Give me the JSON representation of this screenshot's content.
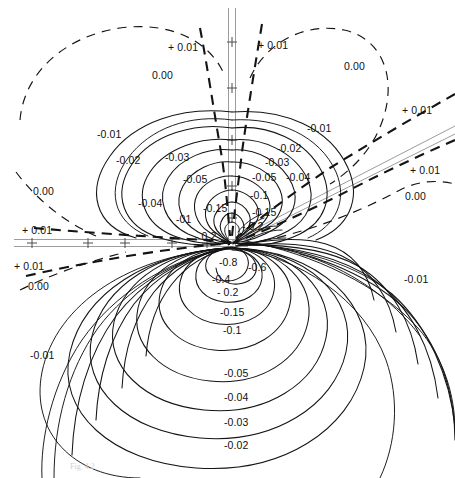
{
  "figure": {
    "title": "",
    "type": "contour-plot",
    "background": "#ffffff",
    "ink_color": "#141414",
    "axis_color": "#9a9a9a",
    "width": 455,
    "height": 478
  },
  "caption": {
    "text": "Fig. 4.2"
  },
  "axes": {
    "vertical": {
      "name": "vertical-axis",
      "x": 232,
      "y_top": 8,
      "y_bottom": 248,
      "ticks": [
        {
          "y": 42
        },
        {
          "y": 88
        },
        {
          "y": 140
        },
        {
          "y": 186
        },
        {
          "y": 218
        },
        {
          "y": 243
        }
      ]
    },
    "horizontal": {
      "name": "horizontal-axis",
      "y": 243,
      "x_left": 14,
      "x_right": 246,
      "ticks": [
        {
          "x": 32
        },
        {
          "x": 88
        },
        {
          "x": 125
        },
        {
          "x": 172
        },
        {
          "x": 207
        }
      ]
    },
    "diagonal": {
      "name": "diagonal-axis",
      "x1": 232,
      "y1": 240,
      "x2": 452,
      "y2": 128
    }
  },
  "chart_data": {
    "type": "contour",
    "title": "",
    "xlabel": "",
    "ylabel": "",
    "grid": false,
    "legend": "none",
    "center": {
      "x": 232,
      "y": 240
    },
    "levels_negative": [
      -0.8,
      -0.6,
      -0.4,
      -0.2,
      -0.15,
      -0.1,
      -0.05,
      -0.04,
      -0.03,
      -0.02,
      -0.01
    ],
    "levels_zero": [
      0.0
    ],
    "levels_positive": [
      0.01
    ],
    "line_styles": {
      "negative": "solid",
      "zero": "dashed",
      "positive": "dashed"
    },
    "contour_labels": [
      {
        "text": "+ 0.01",
        "x": 168,
        "y": 42,
        "value": 0.01
      },
      {
        "text": "+ 0.01",
        "x": 258,
        "y": 40,
        "value": 0.01
      },
      {
        "text": "0.00",
        "x": 152,
        "y": 70,
        "value": 0.0
      },
      {
        "text": "0.00",
        "x": 344,
        "y": 61,
        "value": 0.0
      },
      {
        "text": "+ 0.01",
        "x": 402,
        "y": 105,
        "value": 0.01
      },
      {
        "text": "-0.01",
        "x": 307,
        "y": 123,
        "value": -0.01
      },
      {
        "text": "-0.01",
        "x": 97,
        "y": 129,
        "value": -0.01
      },
      {
        "text": "-0.02",
        "x": 277,
        "y": 143,
        "value": -0.02
      },
      {
        "text": "-0.02",
        "x": 116,
        "y": 155,
        "value": -0.02
      },
      {
        "text": "-0.03",
        "x": 165,
        "y": 152,
        "value": -0.03
      },
      {
        "text": "-0.03",
        "x": 265,
        "y": 157,
        "value": -0.03
      },
      {
        "text": "+ 0.01",
        "x": 410,
        "y": 165,
        "value": 0.01
      },
      {
        "text": "0.00",
        "x": 33,
        "y": 186,
        "value": 0.0
      },
      {
        "text": "-0.05",
        "x": 183,
        "y": 174,
        "value": -0.05
      },
      {
        "text": "-0.05",
        "x": 252,
        "y": 172,
        "value": -0.05
      },
      {
        "text": "-0.04",
        "x": 286,
        "y": 172,
        "value": -0.04
      },
      {
        "text": "0.00",
        "x": 405,
        "y": 191,
        "value": 0.0
      },
      {
        "text": "-0.04",
        "x": 138,
        "y": 198,
        "value": -0.04
      },
      {
        "text": "-0.1",
        "x": 250,
        "y": 190,
        "value": -0.1
      },
      {
        "text": "-0.15",
        "x": 203,
        "y": 203,
        "value": -0.15
      },
      {
        "text": "-0.15",
        "x": 252,
        "y": 207,
        "value": -0.15
      },
      {
        "text": "-01",
        "x": 176,
        "y": 214,
        "value": -0.1
      },
      {
        "text": "- 0.2",
        "x": 242,
        "y": 221,
        "value": -0.2
      },
      {
        "text": "+ 0.01",
        "x": 22,
        "y": 225,
        "value": 0.01
      },
      {
        "text": "- 0.2",
        "x": 195,
        "y": 231,
        "value": -0.2
      },
      {
        "text": "+ 0.01",
        "x": 14,
        "y": 261,
        "value": 0.01
      },
      {
        "text": "-0.8",
        "x": 219,
        "y": 257,
        "value": -0.8
      },
      {
        "text": "-0.6",
        "x": 248,
        "y": 262,
        "value": -0.6
      },
      {
        "text": "-0.01",
        "x": 404,
        "y": 274,
        "value": -0.01
      },
      {
        "text": "-0.4",
        "x": 212,
        "y": 274,
        "value": -0.4
      },
      {
        "text": "0.00",
        "x": 28,
        "y": 281,
        "value": 0.0
      },
      {
        "text": "- 0.2",
        "x": 217,
        "y": 287,
        "value": -0.2
      },
      {
        "text": "-0.15",
        "x": 220,
        "y": 307,
        "value": -0.15
      },
      {
        "text": "-0.1",
        "x": 223,
        "y": 325,
        "value": -0.1
      },
      {
        "text": "-0.01",
        "x": 30,
        "y": 350,
        "value": -0.01
      },
      {
        "text": "-0.05",
        "x": 224,
        "y": 368,
        "value": -0.05
      },
      {
        "text": "-0.04",
        "x": 224,
        "y": 392,
        "value": -0.04
      },
      {
        "text": "-0.03",
        "x": 224,
        "y": 417,
        "value": -0.03
      },
      {
        "text": "-0.02",
        "x": 224,
        "y": 440,
        "value": -0.02
      }
    ]
  }
}
